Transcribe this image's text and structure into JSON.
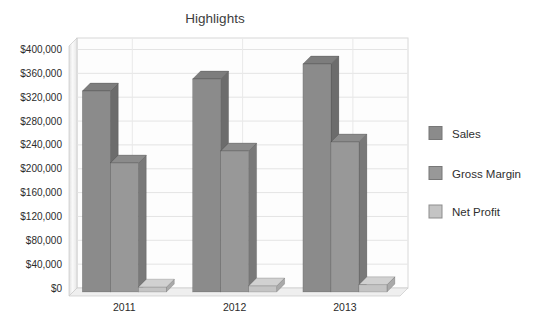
{
  "page": {
    "background_color": "#ffffff"
  },
  "chart_data": {
    "type": "bar",
    "variant": "3d-clustered-column",
    "title": "Highlights",
    "categories": [
      "2011",
      "2012",
      "2013"
    ],
    "series": [
      {
        "name": "Sales",
        "values": [
          335000,
          355000,
          380000
        ],
        "colors": {
          "front": "#8b8b8b",
          "top": "#7d7d7d",
          "side": "#6c6c6c"
        }
      },
      {
        "name": "Gross Margin",
        "values": [
          215000,
          235000,
          250000
        ],
        "colors": {
          "front": "#989898",
          "top": "#8b8b8b",
          "side": "#797979"
        }
      },
      {
        "name": "Net Profit",
        "values": [
          8000,
          10000,
          12000
        ],
        "colors": {
          "front": "#c4c4c4",
          "top": "#d1d1d1",
          "side": "#a9a9a9"
        }
      }
    ],
    "xlabel": "",
    "ylabel": "",
    "ylim": [
      0,
      400000
    ],
    "yticks": {
      "values": [
        0,
        40000,
        80000,
        120000,
        160000,
        200000,
        240000,
        280000,
        320000,
        360000,
        400000
      ],
      "labels": [
        "$0",
        "$40,000",
        "$80,000",
        "$120,000",
        "$160,000",
        "$200,000",
        "$240,000",
        "$280,000",
        "$320,000",
        "$360,000",
        "$400,000"
      ]
    },
    "grid": true,
    "legend_position": "right",
    "wall_colors": {
      "back_wall": "#fdfdfd",
      "side_wall_light": "#f7f7f7",
      "side_wall_dark": "#dddddd",
      "floor": "#efefef",
      "gridline": "#e4e4e4",
      "edge": "#c9c9c9"
    }
  }
}
